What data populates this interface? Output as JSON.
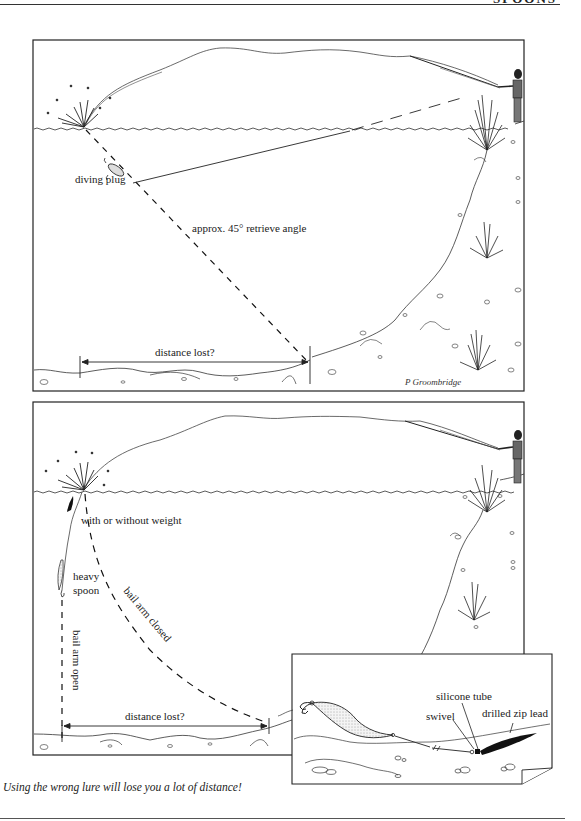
{
  "header": {
    "running_title": "SPOONS"
  },
  "figure_top": {
    "labels": {
      "lure": "diving plug",
      "angle": "approx. 45° retrieve angle",
      "distance": "distance lost?"
    },
    "signature": "P Groombridge"
  },
  "figure_bottom": {
    "labels": {
      "weight": "with or without weight",
      "spoon_line1": "heavy",
      "spoon_line2": "spoon",
      "bail_open": "bail arm open",
      "bail_closed": "bail arm closed",
      "distance": "distance lost?"
    },
    "inset": {
      "labels": {
        "tube": "silicone tube",
        "swivel": "swivel",
        "lead": "drilled zip lead"
      }
    }
  },
  "caption": "Using the wrong lure will lose you a lot of distance!"
}
